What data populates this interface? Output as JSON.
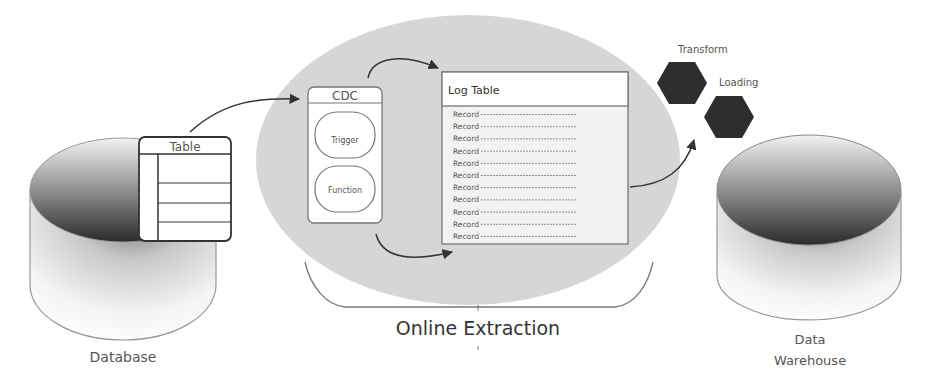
{
  "diagram": {
    "title": "Online Extraction",
    "nodes": {
      "source_db": {
        "label": "Database"
      },
      "source_table": {
        "label": "Table"
      },
      "cdc": {
        "label": "CDC",
        "items": [
          "Trigger",
          "Function"
        ]
      },
      "log_table": {
        "label": "Log Table",
        "records": [
          "Record",
          "Record",
          "Record",
          "Record",
          "Record",
          "Record",
          "Record",
          "Record",
          "Record",
          "Record",
          "Record"
        ]
      },
      "transform": {
        "label": "Transform"
      },
      "loading": {
        "label": "Loading"
      },
      "target_db": {
        "label_line1": "Data",
        "label_line2": "Warehouse"
      }
    },
    "edges": [
      {
        "from": "source_table",
        "to": "cdc"
      },
      {
        "from": "cdc",
        "to": "log_table"
      },
      {
        "from": "cdc",
        "to": "log_table"
      },
      {
        "from": "log_table",
        "to": "transform"
      }
    ],
    "colors": {
      "extraction_ellipse": "#d6d6d6",
      "hexagon": "#2e2e2e",
      "stroke": "#555555",
      "text": "#555555"
    }
  }
}
